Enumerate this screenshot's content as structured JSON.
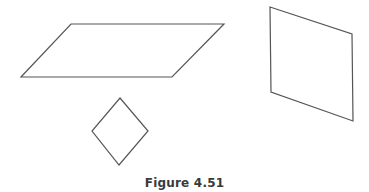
{
  "caption": "Figure 4.51",
  "stroke_color": "#555555",
  "shapes": [
    {
      "name": "parallelogram",
      "points": "71,24 224,24 172,77 21,77"
    },
    {
      "name": "rhombus",
      "points": "120,98 148,131 119,165 92,131"
    },
    {
      "name": "quadrilateral",
      "points": "270,7 352,34 353,121 271,92"
    }
  ]
}
